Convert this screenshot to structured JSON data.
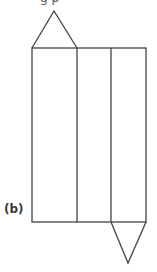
{
  "figure": {
    "label": "(b)",
    "caption_partial": "g  p",
    "stroke_color": "#444444",
    "background": "#ffffff",
    "shapes": {
      "rectangle": {
        "x": 32,
        "y": 48,
        "width": 114,
        "height": 174
      },
      "dividers_x": [
        77,
        111
      ],
      "top_triangle": {
        "points": "32,48 54,11 77,48"
      },
      "bottom_triangle": {
        "points": "111,222 128,263 146,222"
      }
    }
  }
}
